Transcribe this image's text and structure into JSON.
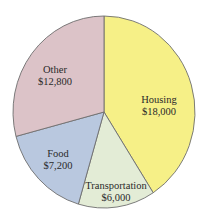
{
  "chart_data": {
    "type": "pie",
    "title": "",
    "start_angle_deg": 0,
    "direction": "clockwise",
    "categories": [
      "Housing",
      "Transportation",
      "Food",
      "Other"
    ],
    "values": [
      18000,
      6000,
      7200,
      12800
    ],
    "value_labels": [
      "$18,000",
      "$6,000",
      "$7,200",
      "$12,800"
    ],
    "colors": [
      "#f6f087",
      "#e3ecd6",
      "#b9c8df",
      "#dcc3c8"
    ],
    "edge_color": "#6e6e6e",
    "legend": "none (labels placed inside slices)"
  },
  "labels": [
    {
      "name": "Housing",
      "value": "$18,000",
      "x": 159,
      "y": 106
    },
    {
      "name": "Transportation",
      "value": "$6,000",
      "x": 116,
      "y": 192
    },
    {
      "name": "Food",
      "value": "$7,200",
      "x": 58,
      "y": 160
    },
    {
      "name": "Other",
      "value": "$12,800",
      "x": 55,
      "y": 76
    }
  ],
  "geometry": {
    "cx": 104,
    "cy": 112,
    "rx": 91,
    "ry": 96
  }
}
